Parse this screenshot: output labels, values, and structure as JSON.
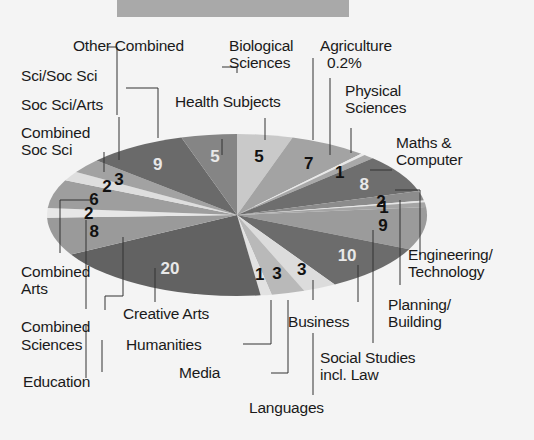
{
  "header_bar": {
    "color": "#a9a9a9"
  },
  "chart_data": {
    "type": "pie",
    "title": "",
    "unit": "%",
    "start_angle_deg": -90,
    "direction": "clockwise",
    "slices": [
      {
        "label": "Health Subjects",
        "value": 5,
        "display": "5",
        "color": "#c9c9c9",
        "text_color": "#111"
      },
      {
        "label": "Biological Sciences",
        "value": 7,
        "display": "7",
        "color": "#a3a3a3",
        "text_color": "#111"
      },
      {
        "label": "Agriculture 0.2%",
        "value": 0.4,
        "display": "",
        "color": "#e9e9e9",
        "text_color": "#111"
      },
      {
        "label": "Physical Sciences",
        "value": 1,
        "display": "1",
        "color": "#a8a8a8",
        "text_color": "#111"
      },
      {
        "label": "Maths & Computer",
        "value": 8,
        "display": "8",
        "color": "#6e6e6e",
        "text_color": "#e8e8e8"
      },
      {
        "label": "Engineering/ Technology",
        "value": 2,
        "display": "2",
        "color": "#8c8c8c",
        "text_color": "#111"
      },
      {
        "label": "",
        "value": 0.4,
        "display": "",
        "color": "#e6e6e6",
        "text_color": "#111"
      },
      {
        "label": "Planning/ Building",
        "value": 1,
        "display": "1",
        "color": "#a5a5a5",
        "text_color": "#111"
      },
      {
        "label": "Social Studies incl. Law",
        "value": 9,
        "display": "9",
        "color": "#9b9b9b",
        "text_color": "#111"
      },
      {
        "label": "Business",
        "value": 10,
        "display": "10",
        "color": "#6c6c6c",
        "text_color": "#e8e8e8"
      },
      {
        "label": "Languages",
        "value": 3,
        "display": "3",
        "color": "#dcdcdc",
        "text_color": "#111"
      },
      {
        "label": "Media",
        "value": 3,
        "display": "3",
        "color": "#b9b9b9",
        "text_color": "#111"
      },
      {
        "label": "Humanities",
        "value": 1,
        "display": "1",
        "color": "#e2e2e2",
        "text_color": "#111"
      },
      {
        "label": "Creative Arts",
        "value": 20,
        "display": "20",
        "color": "#626262",
        "text_color": "#e8e8e8"
      },
      {
        "label": "Education",
        "value": 8,
        "display": "8",
        "color": "#9a9a9a",
        "text_color": "#111"
      },
      {
        "label": "Combined Sciences",
        "value": 2,
        "display": "2",
        "color": "#e7e7e7",
        "text_color": "#111"
      },
      {
        "label": "Combined Arts",
        "value": 6,
        "display": "6",
        "color": "#9e9e9e",
        "text_color": "#111"
      },
      {
        "label": "Combined Soc Sci",
        "value": 2,
        "display": "2",
        "color": "#dedede",
        "text_color": "#111"
      },
      {
        "label": "Soc Sci/Arts",
        "value": 3,
        "display": "3",
        "color": "#a2a2a2",
        "text_color": "#111"
      },
      {
        "label": "Sci/Soc Sci",
        "value": 9,
        "display": "9",
        "color": "#6a6a6a",
        "text_color": "#e8e8e8"
      },
      {
        "label": "Other Combined",
        "value": 5,
        "display": "5",
        "color": "#858585",
        "text_color": "#e8e8e8"
      }
    ],
    "legend_position": "callout labels around pie"
  },
  "labels": {
    "other_combined": "Other Combined",
    "biological_1": "Biological",
    "biological_2": "Sciences",
    "agriculture_1": "Agriculture",
    "agriculture_2": "0.2%",
    "physical_1": "Physical",
    "physical_2": "Sciences",
    "health": "Health Subjects",
    "sci_soc_sci": "Sci/Soc Sci",
    "soc_sci_arts": "Soc Sci/Arts",
    "combined_soc_1": "Combined",
    "combined_soc_2": "Soc Sci",
    "maths_1": "Maths &",
    "maths_2": "Computer",
    "engineering_1": "Engineering/",
    "engineering_2": "Technology",
    "combined_arts_1": "Combined",
    "combined_arts_2": "Arts",
    "planning_1": "Planning/",
    "planning_2": "Building",
    "creative_arts": "Creative Arts",
    "business": "Business",
    "combined_sci_1": "Combined",
    "combined_sci_2": "Sciences",
    "humanities": "Humanities",
    "social_1": "Social Studies",
    "social_2": "incl. Law",
    "media": "Media",
    "education": "Education",
    "languages": "Languages"
  }
}
